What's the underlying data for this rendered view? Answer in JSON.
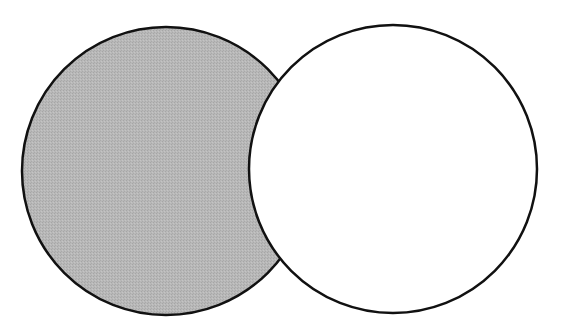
{
  "diagram": {
    "type": "venn",
    "background_color": "#ffffff",
    "stroke_color": "#111111",
    "stroke_width": 2.5,
    "sets": [
      {
        "id": "A",
        "label": "",
        "cx": 166,
        "cy": 171,
        "r": 144,
        "fill": "#b4b4b4",
        "shaded": true
      },
      {
        "id": "B",
        "label": "",
        "cx": 393,
        "cy": 169,
        "r": 144,
        "fill": "#ffffff",
        "shaded": false
      }
    ],
    "shaded_region": "A \\ B"
  }
}
